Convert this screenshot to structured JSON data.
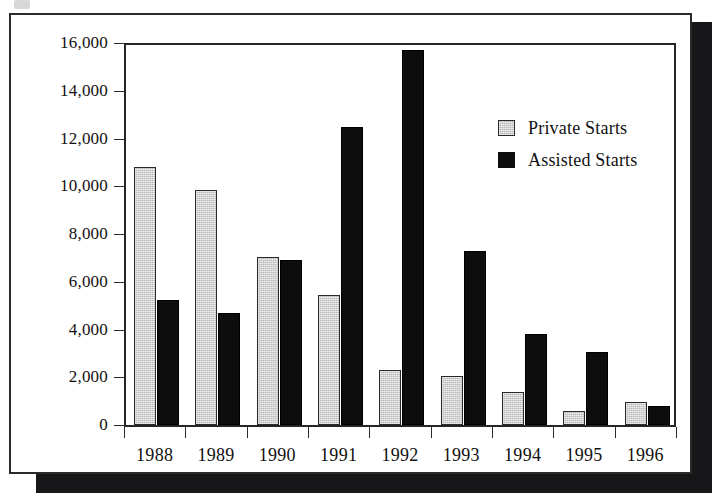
{
  "chart_data": {
    "type": "bar",
    "title": "",
    "xlabel": "",
    "ylabel": "",
    "categories": [
      "1988",
      "1989",
      "1990",
      "1991",
      "1992",
      "1993",
      "1994",
      "1995",
      "1996"
    ],
    "series": [
      {
        "name": "Private Starts",
        "color": "#b9b9b9",
        "values": [
          10800,
          9850,
          7050,
          5450,
          2300,
          2050,
          1400,
          600,
          950
        ]
      },
      {
        "name": "Assisted Starts",
        "color": "#0d0d0d",
        "values": [
          5250,
          4700,
          6900,
          12500,
          15700,
          7300,
          3800,
          3050,
          800
        ]
      }
    ],
    "ylim": [
      0,
      16000
    ],
    "ytick_values": [
      0,
      2000,
      4000,
      6000,
      8000,
      10000,
      12000,
      14000,
      16000
    ],
    "ytick_labels": [
      "0",
      "2,000",
      "4,000",
      "6,000",
      "8,000",
      "10,000",
      "12,000",
      "14,000",
      "16,000"
    ],
    "grid": false,
    "legend_position": "upper-right"
  },
  "legend": {
    "entries": [
      {
        "label": "Private Starts",
        "swatch": "gray-square-icon"
      },
      {
        "label": "Assisted Starts",
        "swatch": "black-square-icon"
      }
    ]
  }
}
